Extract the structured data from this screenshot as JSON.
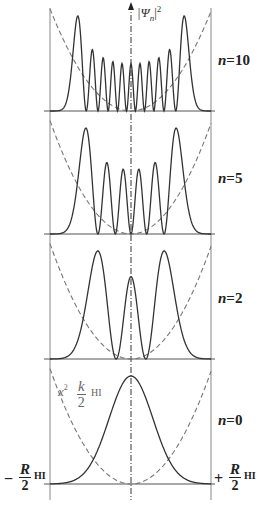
{
  "figure": {
    "y_axis_label": "|Ψ",
    "y_axis_sub": "n",
    "y_axis_sup": "2",
    "potential_label": {
      "var": "x",
      "sup": "2",
      "num": "k",
      "sub": "HI",
      "den": "2"
    },
    "left_bound": {
      "sign": "−",
      "num": "R",
      "sub": "HI",
      "den": "2"
    },
    "right_bound": {
      "sign": "+",
      "num": "R",
      "sub": "HI",
      "den": "2"
    },
    "panels": [
      {
        "label": "n=10",
        "n": 10
      },
      {
        "label": "n=5",
        "n": 5
      },
      {
        "label": "n=2",
        "n": 2
      },
      {
        "label": "n=0",
        "n": 0
      }
    ]
  },
  "chart_data": {
    "type": "line",
    "xlabel": "x (from −R_HI/2 to +R_HI/2)",
    "ylabel": "|Ψn|²",
    "series": [
      {
        "name": "n=10",
        "peaks": 11,
        "description": "11 peaks; outer peaks tallest, inner peaks lower and roughly equal"
      },
      {
        "name": "n=5",
        "peaks": 6,
        "description": "6 peaks; outer pair tallest"
      },
      {
        "name": "n=2",
        "peaks": 3,
        "description": "3 peaks; outer two taller than central"
      },
      {
        "name": "n=0",
        "peaks": 1,
        "description": "single Gaussian peak centered at x=0"
      },
      {
        "name": "potential",
        "style": "dashed",
        "description": "parabola x²·k_HI/2 repeated in each panel"
      }
    ],
    "grid": false,
    "legend": "none; n labels on right side of each panel"
  }
}
